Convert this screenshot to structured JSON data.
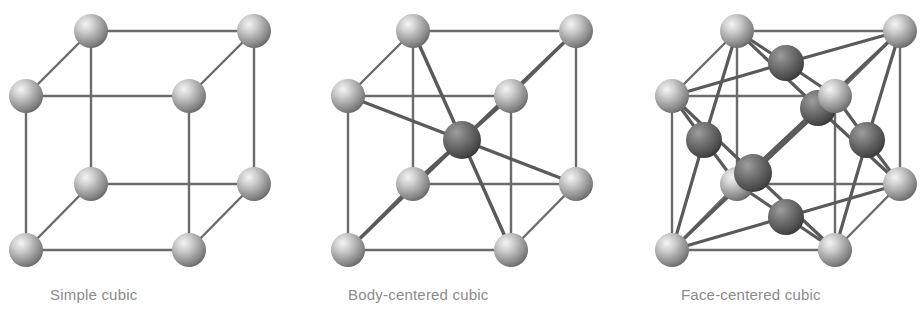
{
  "figure": {
    "background_color": "#ffffff",
    "width": 922,
    "height": 318
  },
  "palette": {
    "corner_atom_light": "#f2f2f2",
    "corner_atom_mid": "#a8a8a8",
    "corner_atom_dark": "#6e6e6e",
    "interior_atom_light": "#9a9a9a",
    "interior_atom_mid": "#6a6a6a",
    "interior_atom_dark": "#3c3c3c",
    "bond_color": "#5a5a5a",
    "thin_edge_color": "#6b6b6b",
    "label_color": "#8b8b8b"
  },
  "diagrams": [
    {
      "id": "simple-cubic",
      "label": "Simple cubic",
      "label_x": 50,
      "label_y": 300,
      "atom_counts": {
        "corner": 8,
        "body_center": 0,
        "face_center": 0
      },
      "total_atoms_drawn": 8,
      "cube": {
        "front_top_left": [
          26,
          96
        ],
        "front_top_right": [
          189,
          96
        ],
        "back_top_left": [
          91,
          31
        ],
        "back_top_right": [
          254,
          31
        ],
        "front_bottom_left": [
          26,
          250
        ],
        "front_bottom_right": [
          189,
          250
        ],
        "back_bottom_left": [
          91,
          184
        ],
        "back_bottom_right": [
          254,
          184
        ]
      },
      "atom_radius": 17
    },
    {
      "id": "body-centered-cubic",
      "label": "Body-centered cubic",
      "label_x": 348,
      "label_y": 300,
      "atom_counts": {
        "corner": 8,
        "body_center": 1,
        "face_center": 0
      },
      "total_atoms_drawn": 9,
      "cube": {
        "front_top_left": [
          348,
          96
        ],
        "front_top_right": [
          511,
          96
        ],
        "back_top_left": [
          413,
          31
        ],
        "back_top_right": [
          576,
          31
        ],
        "front_bottom_left": [
          348,
          250
        ],
        "front_bottom_right": [
          511,
          250
        ],
        "back_bottom_left": [
          413,
          184
        ],
        "back_bottom_right": [
          576,
          184
        ]
      },
      "body_center": [
        462,
        140
      ],
      "atom_radius": 17
    },
    {
      "id": "face-centered-cubic",
      "label": "Face-centered cubic",
      "label_x": 681,
      "label_y": 300,
      "atom_counts": {
        "corner": 8,
        "body_center": 0,
        "face_center": 6
      },
      "total_atoms_drawn": 14,
      "cube": {
        "front_top_left": [
          672,
          96
        ],
        "front_top_right": [
          835,
          96
        ],
        "back_top_left": [
          737,
          31
        ],
        "back_top_right": [
          900,
          31
        ],
        "front_bottom_left": [
          672,
          250
        ],
        "front_bottom_right": [
          835,
          250
        ],
        "back_bottom_left": [
          737,
          184
        ],
        "back_bottom_right": [
          900,
          184
        ]
      },
      "face_centers": {
        "top": [
          786,
          63
        ],
        "bottom": [
          786,
          217
        ],
        "front": [
          753,
          173
        ],
        "back": [
          818,
          108
        ],
        "left": [
          704,
          140
        ],
        "right": [
          867,
          140
        ]
      },
      "atom_radius": 17
    }
  ]
}
